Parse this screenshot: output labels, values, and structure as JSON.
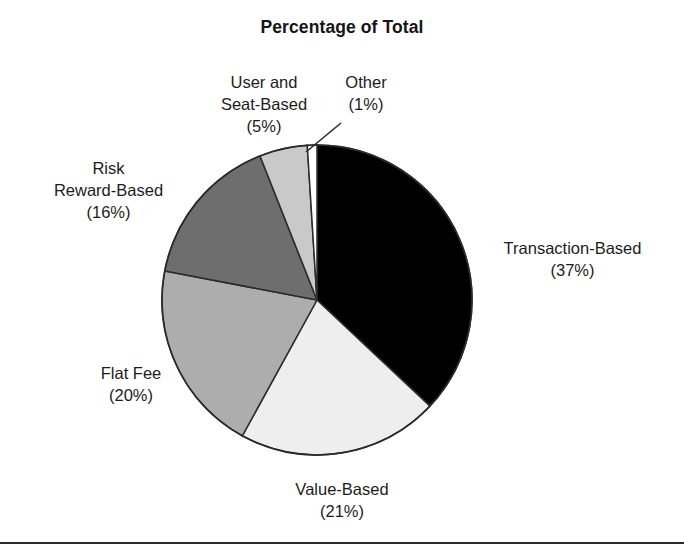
{
  "chart_data": {
    "type": "pie",
    "title": "Percentage of Total",
    "xlabel": "",
    "ylabel": "",
    "legend_position": "none (direct slice labels)",
    "grid": false,
    "units": "percent",
    "total": 100,
    "start_angle_deg_from_12oclock": 0,
    "direction": "clockwise",
    "categories": [
      "Transaction-Based",
      "Value-Based",
      "Flat Fee",
      "Risk Reward-Based",
      "User and Seat-Based",
      "Other"
    ],
    "values": [
      37,
      21,
      20,
      16,
      5,
      1
    ],
    "slices": [
      {
        "name": "Transaction-Based",
        "value": 37,
        "value_text": "(37%)",
        "label_lines": [
          "Transaction-Based",
          "(37%)"
        ],
        "color": "#000000",
        "start_deg": 0,
        "end_deg": 133.2
      },
      {
        "name": "Value-Based",
        "value": 21,
        "value_text": "(21%)",
        "label_lines": [
          "Value-Based",
          "(21%)"
        ],
        "color": "#eeeeee",
        "start_deg": 133.2,
        "end_deg": 208.8
      },
      {
        "name": "Flat Fee",
        "value": 20,
        "value_text": "(20%)",
        "label_lines": [
          "Flat Fee",
          "(20%)"
        ],
        "color": "#adadad",
        "start_deg": 208.8,
        "end_deg": 280.8
      },
      {
        "name": "Risk Reward-Based",
        "value": 16,
        "value_text": "(16%)",
        "label_lines": [
          "Risk",
          "Reward-Based",
          "(16%)"
        ],
        "color": "#6e6e6e",
        "start_deg": 280.8,
        "end_deg": 338.4
      },
      {
        "name": "User and Seat-Based",
        "value": 5,
        "value_text": "(5%)",
        "label_lines": [
          "User and",
          "Seat-Based",
          "(5%)"
        ],
        "color": "#c9c9c9",
        "start_deg": 338.4,
        "end_deg": 356.4
      },
      {
        "name": "Other",
        "value": 1,
        "value_text": "(1%)",
        "label_lines": [
          "Other",
          "(1%)"
        ],
        "color": "#ffffff",
        "start_deg": 356.4,
        "end_deg": 360
      }
    ]
  },
  "figure": {
    "title": "Percentage of Total",
    "labels": {
      "transaction": {
        "line1": "Transaction-Based",
        "line2": "(37%)"
      },
      "value": {
        "line1": "Value-Based",
        "line2": "(21%)"
      },
      "flat_fee": {
        "line1": "Flat Fee",
        "line2": "(20%)"
      },
      "risk": {
        "line1": "Risk",
        "line2": "Reward-Based",
        "line3": "(16%)"
      },
      "user_seat": {
        "line1": "User and",
        "line2": "Seat-Based",
        "line3": "(5%)"
      },
      "other": {
        "line1": "Other",
        "line2": "(1%)"
      }
    },
    "colors": {
      "transaction": "#000000",
      "value": "#eeeeee",
      "flat_fee": "#adadad",
      "risk": "#6e6e6e",
      "user_seat": "#c9c9c9",
      "other": "#ffffff",
      "outline": "#2b2b2b",
      "background": "#ffffff",
      "text": "#1c1c1c",
      "footer_rule": "#2b2b2b"
    }
  }
}
